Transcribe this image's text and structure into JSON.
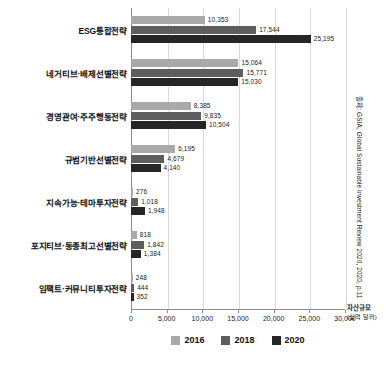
{
  "chart_data": {
    "type": "bar",
    "orientation": "horizontal",
    "title": "",
    "xlabel": "자산규모",
    "xlabel_unit": "(십억 달러)",
    "ylabel": "",
    "xlim": [
      0,
      30000
    ],
    "grid": true,
    "legend_position": "bottom",
    "categories": [
      "ESG통합전략",
      "네거티브·배제선별전략",
      "경영관여·주주행동전략",
      "규범기반선별전략",
      "지속가능·테마투자전략",
      "포지티브·동종최고선별전략",
      "임팩트·커뮤니티투자전략"
    ],
    "xticks": [
      "0",
      "5,000",
      "10,000",
      "15,000",
      "20,000",
      "25,000",
      "30,000"
    ],
    "xtick_values": [
      0,
      5000,
      10000,
      15000,
      20000,
      25000,
      30000
    ],
    "series": [
      {
        "name": "2016",
        "color": "#a9a9a9",
        "values": [
          10353,
          15064,
          8385,
          6195,
          276,
          818,
          248
        ],
        "labels": [
          "10,353",
          "15,064",
          "8,385",
          "6,195",
          "276",
          "818",
          "248"
        ]
      },
      {
        "name": "2018",
        "color": "#5e5e5e",
        "values": [
          17544,
          15771,
          9835,
          4679,
          1018,
          1842,
          444
        ],
        "labels": [
          "17,544",
          "15,771",
          "9,835",
          "4,679",
          "1,018",
          "1,842",
          "444"
        ]
      },
      {
        "name": "2020",
        "color": "#262626",
        "values": [
          25195,
          15030,
          10504,
          4140,
          1948,
          1384,
          352
        ],
        "labels": [
          "25,195",
          "15,030",
          "10,504",
          "4,140",
          "1,948",
          "1,384",
          "352"
        ]
      }
    ]
  },
  "source_note": "출처: GSIA, Global Sustainable Investment Review 2020, 2020, p.11"
}
